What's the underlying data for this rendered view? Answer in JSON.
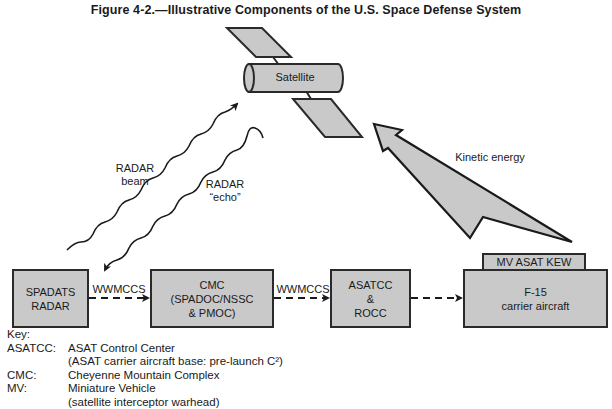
{
  "title": "Figure 4-2.—Illustrative Components of the U.S. Space Defense System",
  "satellite": {
    "label": "Satellite"
  },
  "radar_beam": {
    "label_line1": "RADAR",
    "label_line2": "beam"
  },
  "radar_echo": {
    "label_line1": "RADAR",
    "label_line2": "“echo”"
  },
  "kinetic_energy": {
    "label": "Kinetic energy"
  },
  "boxes": {
    "spadats": {
      "line1": "SPADATS",
      "line2": "RADAR"
    },
    "cmc": {
      "line1": "CMC",
      "line2": "(SPADOC/NSSC",
      "line3": "& PMOC)"
    },
    "asatcc": {
      "line1": "ASATCC",
      "line2": "&",
      "line3": "ROCC"
    },
    "mv_asat_kew": {
      "line1": "MV ASAT KEW"
    },
    "f15": {
      "line1": "F-15",
      "line2": "carrier aircraft"
    }
  },
  "links": {
    "link1": "WWMCCS",
    "link2": "WWMCCS"
  },
  "key": {
    "heading": "Key:",
    "entries": [
      {
        "abbr": "ASATCC:",
        "text": "ASAT Control Center"
      },
      {
        "abbr": "",
        "text": "(ASAT carrier aircraft base: pre-launch C²)"
      },
      {
        "abbr": "CMC:",
        "text": "Cheyenne Mountain Complex"
      },
      {
        "abbr": "MV:",
        "text": "Miniature Vehicle"
      },
      {
        "abbr": "",
        "text": "(satellite interceptor warhead)"
      }
    ]
  },
  "colors": {
    "fill": "#c9c9c9",
    "stroke": "#2a2a2a",
    "background": "#ffffff"
  }
}
